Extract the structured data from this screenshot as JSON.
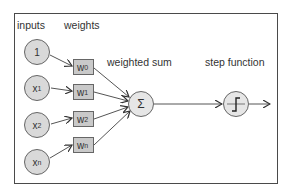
{
  "diagram": {
    "headers": {
      "inputs": "inputs",
      "weights": "weights",
      "weighted_sum": "weighted sum",
      "step_function": "step function"
    },
    "inputs": [
      {
        "base": "1",
        "sub": ""
      },
      {
        "base": "x",
        "sub": "1"
      },
      {
        "base": "x",
        "sub": "2"
      },
      {
        "base": "x",
        "sub": "n"
      }
    ],
    "weights": [
      {
        "base": "w",
        "sub": "0"
      },
      {
        "base": "w",
        "sub": "1"
      },
      {
        "base": "w",
        "sub": "2"
      },
      {
        "base": "w",
        "sub": "n"
      }
    ],
    "sum_symbol": "Σ",
    "colors": {
      "node_fill": "#d9d9d9",
      "weight_fill": "#c9c9c9",
      "stroke": "#555555"
    }
  }
}
